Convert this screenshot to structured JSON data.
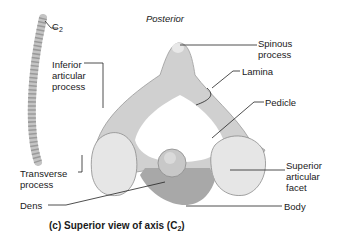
{
  "figure": {
    "caption": "(c) Superior view of axis (C",
    "caption_sub": "2",
    "caption_end": ")",
    "orientation_label": "Posterior"
  },
  "spine_thumbnail": {
    "label": "C",
    "label_sub": "2"
  },
  "labels": {
    "inferior_articular_process": "Inferior\narticular\nprocess",
    "transverse_process": "Transverse\nprocess",
    "dens": "Dens",
    "spinous_process": "Spinous\nprocess",
    "lamina": "Lamina",
    "pedicle": "Pedicle",
    "superior_articular_facet": "Superior\narticular\nfacet",
    "body": "Body"
  },
  "colors": {
    "bone_fill": "#d4d4d4",
    "bone_shade": "#b0b0b0",
    "facet_fill": "#e8e8e8",
    "leader_line": "#222222"
  }
}
